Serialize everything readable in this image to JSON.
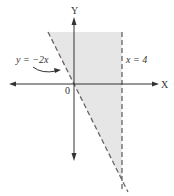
{
  "figure": {
    "x_axis_label": "X",
    "y_axis_label": "Y",
    "origin_label": "0",
    "boundary_1": {
      "label": "y = −2x",
      "equation": "y = -2x",
      "style": "dashed"
    },
    "boundary_2": {
      "label": "x = 4",
      "equation": "x = 4",
      "style": "dashed"
    },
    "shaded_region": {
      "description": "y > -2x and x < 4",
      "inequalities": [
        "y > -2x",
        "x < 4"
      ]
    },
    "colors": {
      "shade": "#e6e6e6",
      "axis": "#333333",
      "dashed_line": "#666666"
    }
  }
}
